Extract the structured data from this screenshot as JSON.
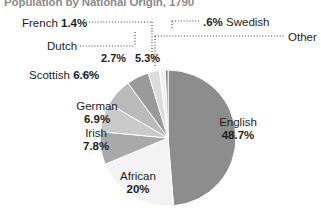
{
  "chart": {
    "title": "Population by National Origin, 1790"
  },
  "chart_data": {
    "type": "pie",
    "title": "Population by National Origin, 1790",
    "xlabel": "",
    "ylabel": "",
    "grid": false,
    "legend_position": "none",
    "unit": "percent",
    "categories": [
      "English",
      "African",
      "Irish",
      "German",
      "Scottish",
      "Other",
      "Dutch",
      "French",
      "Swedish"
    ],
    "values": [
      48.7,
      20.0,
      7.8,
      6.9,
      6.6,
      5.3,
      2.7,
      1.4,
      0.6
    ],
    "labels": [
      "48.7%",
      "20%",
      "7.8%",
      "6.9%",
      "6.6%",
      "5.3%",
      "2.7%",
      "1.4%",
      ".6%"
    ],
    "colors": [
      "#8d8d8d",
      "#f3f3f3",
      "#a9a9a9",
      "#cacaca",
      "#bababa",
      "#9a9a9a",
      "#dcdcdc",
      "#f0f0f0",
      "#6e6e6e"
    ],
    "slices": [
      {
        "name": "English",
        "value": 48.7,
        "label": "48.7%",
        "color": "#8d8d8d",
        "label_placement": "inside"
      },
      {
        "name": "African",
        "value": 20.0,
        "label": "20%",
        "color": "#f3f3f3",
        "label_placement": "inside"
      },
      {
        "name": "Irish",
        "value": 7.8,
        "label": "7.8%",
        "color": "#a9a9a9",
        "label_placement": "inside"
      },
      {
        "name": "German",
        "value": 6.9,
        "label": "6.9%",
        "color": "#cacaca",
        "label_placement": "inside"
      },
      {
        "name": "Scottish",
        "value": 6.6,
        "label": "6.6%",
        "color": "#bababa",
        "label_placement": "callout-left"
      },
      {
        "name": "Other",
        "value": 5.3,
        "label": "5.3%",
        "color": "#9a9a9a",
        "label_placement": "callout-right"
      },
      {
        "name": "Dutch",
        "value": 2.7,
        "label": "2.7%",
        "color": "#dcdcdc",
        "label_placement": "callout-left"
      },
      {
        "name": "French",
        "value": 1.4,
        "label": "1.4%",
        "color": "#f0f0f0",
        "label_placement": "callout-left"
      },
      {
        "name": "Swedish",
        "value": 0.6,
        "label": ".6%",
        "color": "#6e6e6e",
        "label_placement": "callout-right"
      }
    ]
  },
  "labels": {
    "french_name": "French",
    "french_pct": "1.4%",
    "dutch_name": "Dutch",
    "dutch_pct": "2.7%",
    "swedish_pct": ".6%",
    "swedish_name": "Swedish",
    "other_name": "Other",
    "other_pct": "5.3%",
    "scottish_name": "Scottish",
    "scottish_pct": "6.6%",
    "german_name": "German",
    "german_pct": "6.9%",
    "irish_name": "Irish",
    "irish_pct": "7.8%",
    "african_name": "African",
    "african_pct": "20%",
    "english_name": "English",
    "english_pct": "48.7%"
  }
}
